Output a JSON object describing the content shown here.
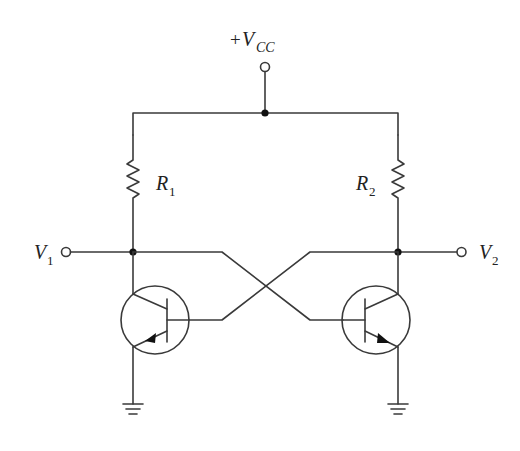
{
  "diagram": {
    "type": "circuit-schematic",
    "supply": {
      "prefix": "+",
      "symbol": "V",
      "subscript": "CC"
    },
    "resistors": [
      {
        "symbol": "R",
        "subscript": "1"
      },
      {
        "symbol": "R",
        "subscript": "2"
      }
    ],
    "outputs": [
      {
        "symbol": "V",
        "subscript": "1"
      },
      {
        "symbol": "V",
        "subscript": "2"
      }
    ],
    "transistors": [
      {
        "id": "Q-left",
        "type": "npn"
      },
      {
        "id": "Q-right",
        "type": "npn"
      }
    ],
    "colors": {
      "wire": "#3a3a3a",
      "node": "#111111",
      "background": "#ffffff"
    }
  }
}
